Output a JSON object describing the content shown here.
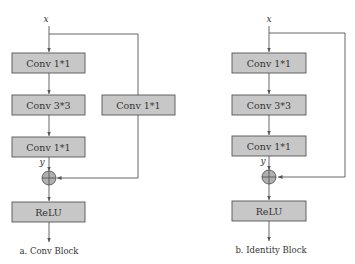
{
  "diagram": {
    "conv_block": {
      "input_label": "x",
      "output_label": "y",
      "main_path": [
        "Conv 1*1",
        "Conv 3*3",
        "Conv 1*1"
      ],
      "shortcut": "Conv 1*1",
      "activation": "ReLU",
      "caption": "a. Conv Block",
      "merge_op": "add"
    },
    "identity_block": {
      "input_label": "x",
      "output_label": "y",
      "main_path": [
        "Conv 1*1",
        "Conv 3*3",
        "Conv 1*1"
      ],
      "shortcut": "identity",
      "activation": "ReLU",
      "caption": "b. Identity Block",
      "merge_op": "add"
    }
  }
}
